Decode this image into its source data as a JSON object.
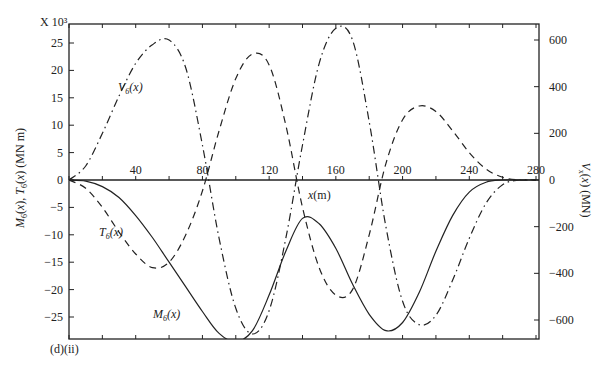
{
  "chart_data": {
    "type": "line",
    "panel_label": "(d)(ii)",
    "xlabel": "x(m)",
    "ylabel_left": "M6(x), T6(x) (MN m)",
    "ylabel_right": "Vx(x) (MN)",
    "left_axis_multiplier": "X 10³",
    "xlim": [
      0,
      282
    ],
    "ylim_left": [
      -29,
      28.5
    ],
    "ylim_right": [
      -630,
      620
    ],
    "x_ticks": [
      0,
      20,
      40,
      60,
      80,
      100,
      120,
      140,
      160,
      180,
      200,
      220,
      240,
      260,
      280
    ],
    "x_tick_labels": [
      "40",
      "80",
      "120",
      "160",
      "200",
      "240",
      "280"
    ],
    "x_tick_label_values": [
      40,
      80,
      120,
      160,
      200,
      240,
      280
    ],
    "y_left_ticks": [
      25,
      20,
      15,
      10,
      5,
      0,
      -5,
      -10,
      -15,
      -20,
      -25
    ],
    "y_left_tick_labels": [
      "25",
      "20",
      "15",
      "10",
      "5",
      "0",
      "−5",
      "−10",
      "−15",
      "−20",
      "−25"
    ],
    "y_right_ticks": [
      600,
      400,
      200,
      0,
      -200,
      -400,
      -600
    ],
    "y_right_tick_labels": [
      "600",
      "400",
      "200",
      "0",
      "−200",
      "−400",
      "−600"
    ],
    "grid": false,
    "legend": "inline curve labels",
    "series": [
      {
        "name": "M6(x)",
        "label": "M",
        "label_sub": "6",
        "label_arg": "(x)",
        "axis": "left",
        "style": "solid",
        "x": [
          0,
          10,
          20,
          30,
          40,
          50,
          60,
          70,
          80,
          90,
          100,
          110,
          120,
          130,
          140,
          150,
          160,
          170,
          180,
          190,
          200,
          210,
          220,
          230,
          240,
          250,
          260,
          270,
          280
        ],
        "y": [
          0,
          -0.2,
          -1.2,
          -3.2,
          -6.5,
          -10.5,
          -15,
          -19.5,
          -24,
          -28,
          -29.5,
          -27.5,
          -21,
          -13,
          -7,
          -8,
          -12.5,
          -19,
          -24.5,
          -27.5,
          -26,
          -20.5,
          -13,
          -6.5,
          -2.2,
          -0.4,
          0,
          0,
          0
        ]
      },
      {
        "name": "T6(x)",
        "label": "T",
        "label_sub": "6",
        "label_arg": "(x)",
        "axis": "left",
        "style": "dashed",
        "x": [
          0,
          10,
          20,
          30,
          40,
          50,
          60,
          70,
          80,
          90,
          100,
          110,
          120,
          130,
          140,
          150,
          160,
          170,
          180,
          190,
          200,
          210,
          220,
          230,
          240,
          250,
          260,
          270,
          280
        ],
        "y": [
          0,
          -1.5,
          -5,
          -9.5,
          -13.5,
          -16,
          -15,
          -10,
          -2,
          9,
          18.5,
          23,
          21,
          10,
          -5,
          -16,
          -21,
          -20,
          -10,
          3,
          11,
          13.5,
          12.5,
          9,
          5,
          2,
          0.5,
          0,
          0
        ]
      },
      {
        "name": "V6(x)",
        "label": "V",
        "label_sub": "6",
        "label_arg": "(x)",
        "axis": "right",
        "style": "dash-dot",
        "x": [
          0,
          10,
          20,
          30,
          40,
          50,
          60,
          70,
          80,
          90,
          100,
          110,
          120,
          130,
          140,
          150,
          160,
          170,
          180,
          190,
          200,
          210,
          220,
          230,
          240,
          250,
          260,
          270,
          280
        ],
        "y": [
          0,
          60,
          200,
          360,
          500,
          580,
          600,
          480,
          150,
          -250,
          -550,
          -660,
          -560,
          -250,
          150,
          500,
          650,
          600,
          250,
          -200,
          -520,
          -620,
          -580,
          -430,
          -250,
          -100,
          -20,
          0,
          0
        ]
      }
    ],
    "annotations": [
      {
        "text": "V6(x)",
        "x_px": 118,
        "y_px": 91
      },
      {
        "text": "T6(x)",
        "x_px": 99,
        "y_px": 236
      },
      {
        "text": "M6(x)",
        "x_px": 153,
        "y_px": 318
      },
      {
        "text": "x(m)",
        "x_px": 308,
        "y_px": 198
      }
    ]
  }
}
